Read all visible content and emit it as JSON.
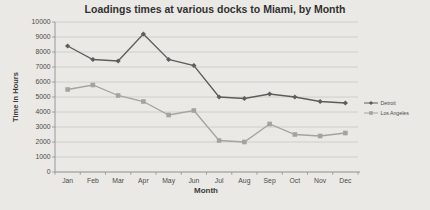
{
  "chart_data": {
    "type": "line",
    "title": "Loadings times at various docks to Miami, by Month",
    "xlabel": "Month",
    "ylabel": "Time in Hours",
    "categories": [
      "Jan",
      "Feb",
      "Mar",
      "Apr",
      "May",
      "Jun",
      "Jul",
      "Aug",
      "Sep",
      "Oct",
      "Nov",
      "Dec"
    ],
    "series": [
      {
        "name": "Detroit",
        "marker": "diamond",
        "color": "#5d5d5b",
        "values": [
          8400,
          7500,
          7400,
          9200,
          7500,
          7100,
          5000,
          4900,
          5200,
          5000,
          4700,
          4600
        ]
      },
      {
        "name": "Los Angeles",
        "marker": "square",
        "color": "#a4a3a0",
        "values": [
          5500,
          5800,
          5100,
          4700,
          3800,
          4100,
          2100,
          2000,
          3200,
          2500,
          2400,
          2600
        ]
      }
    ],
    "ylim": [
      0,
      10000
    ],
    "ytick_step": 1000,
    "grid": true,
    "legend_position": "right"
  },
  "style": {
    "background": "#eae9e6",
    "gridline_color": "#c7c6c3",
    "axis_color": "#908f8c",
    "title_color": "#323130",
    "label_color": "#4a4947"
  }
}
